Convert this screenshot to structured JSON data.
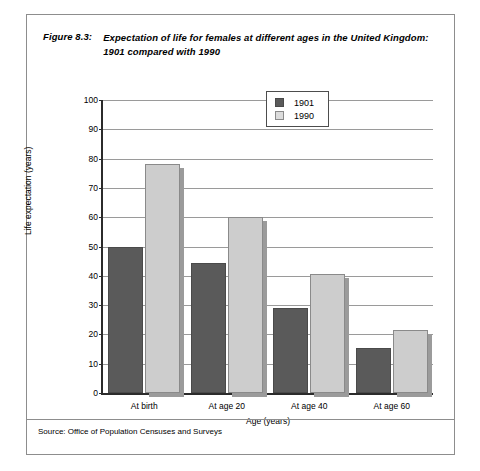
{
  "figure": {
    "label": "Figure 8.3:",
    "title": "Expectation of life for females at different ages in the United Kingdom: 1901 compared with 1990",
    "source": "Source: Office of Population Censuses and Surveys"
  },
  "chart_data": {
    "type": "bar",
    "title": "Expectation of life for females at different ages in the United Kingdom: 1901 compared with 1990",
    "categories": [
      "At birth",
      "At age 20",
      "At age 40",
      "At age 60"
    ],
    "series": [
      {
        "name": "1901",
        "color": "#5a5a5a",
        "values": [
          50,
          44.5,
          29,
          15.5
        ]
      },
      {
        "name": "1990",
        "color": "#cdcdcd",
        "values": [
          78,
          60,
          40.5,
          21.5
        ]
      }
    ],
    "xlabel": "Age (years)",
    "ylabel": "Life expectation (years)",
    "ylim": [
      0,
      100
    ],
    "yticks": [
      0,
      10,
      20,
      30,
      40,
      50,
      60,
      70,
      80,
      90,
      100
    ],
    "ytick_labels": [
      "0",
      "10",
      "20",
      "30",
      "40",
      "50",
      "60",
      "70",
      "80",
      "90",
      "100"
    ],
    "grid": true,
    "legend_position": "top-center"
  }
}
